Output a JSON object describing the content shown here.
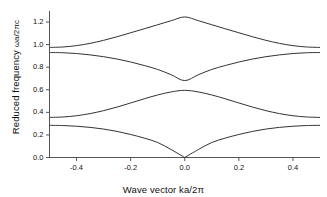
{
  "figure": {
    "background": "#ffffff",
    "line_color": "#333333",
    "axis_color": "#555555",
    "text_color": "#111111"
  },
  "axes": {
    "x_title_main": "Wave vector ka/2",
    "x_title_sub": "π",
    "y_title_main": "Reduced frequency ",
    "y_title_sub": "ωa/2πc",
    "x_ticks": [
      "-0.4",
      "-0.2",
      "0.0",
      "0.2",
      "0.4"
    ],
    "x_tick_values": [
      -0.4,
      -0.2,
      0.0,
      0.2,
      0.4
    ],
    "y_ticks": [
      "0.0",
      "0.2",
      "0.4",
      "0.6",
      "0.8",
      "1.0",
      "1.2"
    ],
    "y_tick_values": [
      0.0,
      0.2,
      0.4,
      0.6,
      0.8,
      1.0,
      1.2
    ]
  },
  "chart_data": {
    "type": "line",
    "title": "",
    "xlabel": "Wave vector ka/2π",
    "ylabel": "Reduced frequency ωa/2πc",
    "xlim": [
      -0.5,
      0.5
    ],
    "ylim": [
      0.0,
      1.28
    ],
    "grid": false,
    "legend": "none",
    "x": [
      -0.5,
      -0.45,
      -0.4,
      -0.35,
      -0.3,
      -0.25,
      -0.2,
      -0.15,
      -0.1,
      -0.05,
      0.0,
      0.05,
      0.1,
      0.15,
      0.2,
      0.25,
      0.3,
      0.35,
      0.4,
      0.45,
      0.5
    ],
    "series": [
      {
        "name": "band-1",
        "values": [
          0.285,
          0.283,
          0.277,
          0.267,
          0.252,
          0.231,
          0.204,
          0.172,
          0.133,
          0.07,
          0.0,
          0.07,
          0.133,
          0.172,
          0.204,
          0.231,
          0.252,
          0.267,
          0.277,
          0.283,
          0.285
        ]
      },
      {
        "name": "band-2",
        "values": [
          0.355,
          0.359,
          0.37,
          0.389,
          0.415,
          0.447,
          0.483,
          0.52,
          0.554,
          0.581,
          0.595,
          0.581,
          0.554,
          0.52,
          0.483,
          0.447,
          0.415,
          0.389,
          0.37,
          0.359,
          0.355
        ]
      },
      {
        "name": "band-3",
        "values": [
          0.93,
          0.928,
          0.921,
          0.909,
          0.893,
          0.872,
          0.846,
          0.815,
          0.78,
          0.733,
          0.681,
          0.733,
          0.78,
          0.815,
          0.846,
          0.872,
          0.893,
          0.909,
          0.921,
          0.928,
          0.93
        ]
      },
      {
        "name": "band-4",
        "values": [
          0.975,
          0.979,
          0.991,
          1.011,
          1.038,
          1.07,
          1.105,
          1.14,
          1.176,
          1.212,
          1.245,
          1.212,
          1.176,
          1.14,
          1.105,
          1.07,
          1.038,
          1.011,
          0.991,
          0.979,
          0.975
        ]
      }
    ],
    "annotations": {
      "band_gap_lower": [
        0.285,
        0.355
      ],
      "band_gap_upper": [
        0.595,
        0.681
      ]
    }
  }
}
